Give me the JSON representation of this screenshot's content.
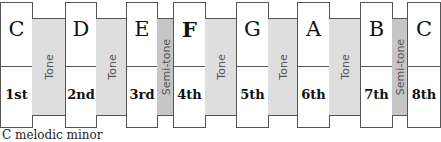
{
  "diagram": {
    "notes": [
      {
        "letter": "C",
        "degree": "1st"
      },
      {
        "letter": "D",
        "degree": "2nd"
      },
      {
        "letter": "E",
        "degree": "3rd"
      },
      {
        "letter": "F",
        "degree": "4th"
      },
      {
        "letter": "G",
        "degree": "5th"
      },
      {
        "letter": "A",
        "degree": "6th"
      },
      {
        "letter": "B",
        "degree": "7th"
      },
      {
        "letter": "C",
        "degree": "8th"
      }
    ],
    "intervals": [
      {
        "label": "Tone",
        "type": "tone"
      },
      {
        "label": "Tone",
        "type": "tone"
      },
      {
        "label": "Semi-tone",
        "type": "semitone"
      },
      {
        "label": "Tone",
        "type": "tone"
      },
      {
        "label": "Tone",
        "type": "tone"
      },
      {
        "label": "Tone",
        "type": "tone"
      },
      {
        "label": "Semi-tone",
        "type": "semitone"
      }
    ],
    "colors": {
      "tone": "#dedede",
      "semitone": "#c6c6c6",
      "note": "#ffffff"
    },
    "caption": "C melodic minor"
  }
}
